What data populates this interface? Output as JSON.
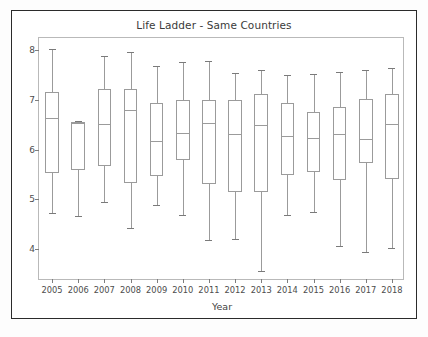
{
  "figure": {
    "title": "Life Ladder - Same Countries",
    "background_color": "#ffffff",
    "frame_color": "#2b2b2b"
  },
  "chart_data": {
    "type": "box",
    "title": "Life Ladder - Same Countries",
    "xlabel": "Year",
    "ylabel": "",
    "grid": false,
    "legend": null,
    "ylim": [
      3.35,
      8.25
    ],
    "yticks": [
      4,
      5,
      6,
      7,
      8
    ],
    "ytick_labels": [
      "4",
      "5",
      "6",
      "7",
      "8"
    ],
    "categories": [
      "2005",
      "2006",
      "2007",
      "2008",
      "2009",
      "2010",
      "2011",
      "2012",
      "2013",
      "2014",
      "2015",
      "2016",
      "2017",
      "2018"
    ],
    "boxes": [
      {
        "label": "2005",
        "whisker_low": 4.73,
        "q1": 5.52,
        "median": 6.63,
        "q3": 7.17,
        "whisker_high": 8.02
      },
      {
        "label": "2006",
        "whisker_low": 4.67,
        "q1": 5.58,
        "median": 6.54,
        "q3": 6.56,
        "whisker_high": 6.57
      },
      {
        "label": "2007",
        "whisker_low": 4.95,
        "q1": 5.66,
        "median": 6.51,
        "q3": 7.23,
        "whisker_high": 7.88
      },
      {
        "label": "2008",
        "whisker_low": 4.42,
        "q1": 5.32,
        "median": 6.79,
        "q3": 7.23,
        "whisker_high": 7.97
      },
      {
        "label": "2009",
        "whisker_low": 4.89,
        "q1": 5.46,
        "median": 6.17,
        "q3": 6.94,
        "whisker_high": 7.68
      },
      {
        "label": "2010",
        "whisker_low": 4.68,
        "q1": 5.79,
        "median": 6.33,
        "q3": 6.99,
        "whisker_high": 7.77
      },
      {
        "label": "2011",
        "whisker_low": 4.18,
        "q1": 5.31,
        "median": 6.53,
        "q3": 7.0,
        "whisker_high": 7.79
      },
      {
        "label": "2012",
        "whisker_low": 4.2,
        "q1": 5.14,
        "median": 6.32,
        "q3": 7.0,
        "whisker_high": 7.54
      },
      {
        "label": "2013",
        "whisker_low": 3.55,
        "q1": 5.15,
        "median": 6.5,
        "q3": 7.13,
        "whisker_high": 7.6
      },
      {
        "label": "2014",
        "whisker_low": 4.68,
        "q1": 5.49,
        "median": 6.27,
        "q3": 6.94,
        "whisker_high": 7.51
      },
      {
        "label": "2015",
        "whisker_low": 4.75,
        "q1": 5.54,
        "median": 6.23,
        "q3": 6.76,
        "whisker_high": 7.52
      },
      {
        "label": "2016",
        "whisker_low": 4.06,
        "q1": 5.38,
        "median": 6.31,
        "q3": 6.85,
        "whisker_high": 7.56
      },
      {
        "label": "2017",
        "whisker_low": 3.94,
        "q1": 5.73,
        "median": 6.22,
        "q3": 7.02,
        "whisker_high": 7.6
      },
      {
        "label": "2018",
        "whisker_low": 4.02,
        "q1": 5.41,
        "median": 6.51,
        "q3": 7.13,
        "whisker_high": 7.64
      }
    ],
    "box_edge_color": "#9b9b9b",
    "box_fill_color": "#ffffff",
    "median_color": "#9b9b9b",
    "whisker_color": "#9b9b9b"
  }
}
